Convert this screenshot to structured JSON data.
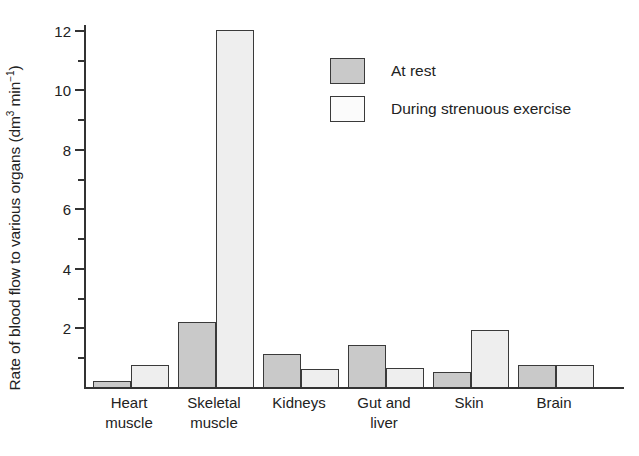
{
  "chart_data": {
    "type": "bar",
    "title": "",
    "xlabel": "",
    "ylabel": "Rate of blood flow to various organs (dm3 min-1)",
    "ylabel_parts": {
      "main": "Rate of blood flow to various organs (dm",
      "sup1": "3",
      "mid": " min",
      "sup2": "−1",
      "tail": ")"
    },
    "categories": [
      "Heart\nmuscle",
      "Skeletal\nmuscle",
      "Kidneys",
      "Gut and\nliver",
      "Skin",
      "Brain"
    ],
    "series": [
      {
        "name": "At rest",
        "values": [
          0.2,
          2.2,
          1.1,
          1.4,
          0.5,
          0.75
        ]
      },
      {
        "name": "During strenuous exercise",
        "values": [
          0.75,
          12.0,
          0.6,
          0.65,
          1.9,
          0.75
        ]
      }
    ],
    "ylim": [
      0,
      12.6
    ],
    "y_major_ticks": [
      2,
      4,
      6,
      8,
      10,
      12
    ],
    "y_minor_ticks": [
      1,
      3,
      5,
      7,
      9,
      11
    ],
    "y_tick_labels": [
      "2",
      "4",
      "6",
      "8",
      "10",
      "12"
    ],
    "grid": false,
    "legend_position": "upper-center",
    "colors": {
      "rest_fill": "#c9c9c9",
      "exercise_fill": "#eeeeee",
      "bar_outline": "#3a3a3a",
      "axis": "#333333",
      "text": "#222222",
      "background": "#ffffff"
    }
  },
  "legend": {
    "items": [
      {
        "label": "At rest",
        "style": "rest"
      },
      {
        "label": "During strenuous exercise",
        "style": "exercise"
      }
    ]
  }
}
